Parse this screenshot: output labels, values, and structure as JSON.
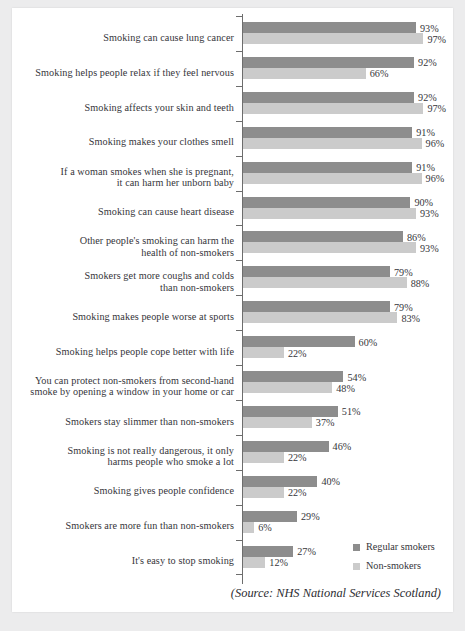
{
  "chart_data": {
    "type": "bar",
    "orientation": "horizontal",
    "title": "",
    "xlabel": "",
    "ylabel": "",
    "xlim": [
      0,
      100
    ],
    "grid": false,
    "legend_position": "bottom-right",
    "value_suffix": "%",
    "categories": [
      "Smoking can cause lung cancer",
      "Smoking helps people relax if they feel nervous",
      "Smoking affects your skin and teeth",
      "Smoking makes your clothes smell",
      "If a woman smokes when she is pregnant,\nit can harm her unborn baby",
      "Smoking can cause heart disease",
      "Other people's smoking can harm the\nhealth of non-smokers",
      "Smokers get more coughs and colds\nthan non-smokers",
      "Smoking makes people worse at sports",
      "Smoking helps people cope better with life",
      "You can protect non-smokers from second-hand\nsmoke by opening a window in your home or car",
      "Smokers stay slimmer than non-smokers",
      "Smoking is not really dangerous, it only\nharms people who smoke a lot",
      "Smoking gives people confidence",
      "Smokers are more fun than non-smokers",
      "It's easy to stop smoking"
    ],
    "series": [
      {
        "name": "Regular smokers",
        "color": "#8d8d8d",
        "values": [
          93,
          92,
          92,
          91,
          91,
          90,
          86,
          79,
          79,
          60,
          54,
          51,
          46,
          40,
          29,
          27
        ],
        "labels": [
          "93%",
          "92%",
          "92%",
          "91%",
          "91%",
          "90%",
          "86%",
          "79%",
          "79%",
          "60%",
          "54%",
          "51%",
          "46%",
          "40%",
          "29%",
          "27%"
        ]
      },
      {
        "name": "Non-smokers",
        "color": "#cbcbcb",
        "values": [
          97,
          66,
          97,
          96,
          96,
          93,
          93,
          88,
          83,
          22,
          48,
          37,
          22,
          22,
          6,
          12
        ],
        "labels": [
          "97%",
          "66%",
          "97%",
          "96%",
          "96%",
          "93%",
          "93%",
          "88%",
          "83%",
          "22%",
          "48%",
          "37%",
          "22%",
          "22%",
          "6%",
          "12%"
        ]
      }
    ],
    "source_note": "(Source: NHS National Services Scotland)"
  }
}
